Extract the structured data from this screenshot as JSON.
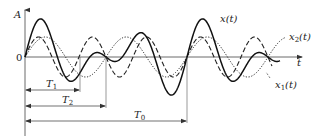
{
  "diagram": {
    "title": "",
    "axes": {
      "y_label": "A",
      "origin_label": "0",
      "x_label": "t"
    },
    "curves": [
      {
        "id": "x",
        "label": "x(t)",
        "label_main": "x(t)",
        "style": "solid",
        "color": "#111111",
        "description": "composite signal x(t) = x1(t) + x2(t), period T0"
      },
      {
        "id": "x1",
        "label": "x1(t)",
        "label_base": "x",
        "label_sub": "1",
        "label_tail": "(t)",
        "style": "dashed",
        "color": "#111111",
        "period_name": "T1"
      },
      {
        "id": "x2",
        "label": "x2(t)",
        "label_base": "x",
        "label_sub": "2",
        "label_tail": "(t)",
        "style": "dotted",
        "color": "#111111",
        "period_name": "T2"
      }
    ],
    "periods": [
      {
        "name": "T1",
        "base": "T",
        "sub": "1"
      },
      {
        "name": "T2",
        "base": "T",
        "sub": "2"
      },
      {
        "name": "T0",
        "base": "T",
        "sub": "0"
      }
    ]
  }
}
